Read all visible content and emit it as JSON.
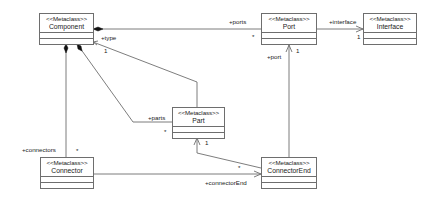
{
  "diagram": {
    "type": "UML class diagram",
    "classes": [
      {
        "id": "component",
        "stereotype": "<<Metaclass>>",
        "name": "Component"
      },
      {
        "id": "port",
        "stereotype": "<<Metaclass>>",
        "name": "Port"
      },
      {
        "id": "interface",
        "stereotype": "<<Metaclass>>",
        "name": "Interface"
      },
      {
        "id": "part",
        "stereotype": "<<Metaclass>>",
        "name": "Part"
      },
      {
        "id": "connector",
        "stereotype": "<<Metaclass>>",
        "name": "Connector"
      },
      {
        "id": "connectorend",
        "stereotype": "<<Metaclass>>",
        "name": "ConnectorEnd"
      }
    ],
    "associations": [
      {
        "from": "Component",
        "to": "Port",
        "kind": "composition",
        "role": "+ports",
        "multiplicity": "*"
      },
      {
        "from": "Port",
        "to": "Interface",
        "kind": "directed",
        "role": "+interface",
        "multiplicity": "1"
      },
      {
        "from": "Part",
        "to": "Component",
        "kind": "directed",
        "role": "+type",
        "multiplicity": "1"
      },
      {
        "from": "Component",
        "to": "Part",
        "kind": "composition",
        "role": "+parts",
        "multiplicity": "*"
      },
      {
        "from": "Component",
        "to": "Connector",
        "kind": "composition",
        "role": "+connectors",
        "multiplicity": "*"
      },
      {
        "from": "ConnectorEnd",
        "to": "Port",
        "kind": "directed",
        "role": "+port",
        "multiplicity": "1"
      },
      {
        "from": "ConnectorEnd",
        "to": "Part",
        "kind": "directed",
        "role": "",
        "multiplicity": "1",
        "source_multiplicity": "*"
      },
      {
        "from": "Connector",
        "to": "ConnectorEnd",
        "kind": "directed",
        "role": "+connectorEnd",
        "multiplicity": "*"
      }
    ],
    "labels": {
      "ports": "+ports",
      "ports_mult": "*",
      "interface": "+interface",
      "interface_mult": "1",
      "type": "+type",
      "type_mult": "1",
      "port": "+port",
      "port_mult": "1",
      "parts": "+parts",
      "parts_mult": "*",
      "part_end_mult": "1",
      "connectorend_src_mult": "*",
      "connectors": "+connectors",
      "connectors_mult": "*",
      "connectorEnd": "+connectorEnd"
    }
  },
  "colors": {
    "line": "#6e6e6e",
    "box_border": "#6e6e6e",
    "text": "#222222",
    "background": "#ffffff"
  }
}
